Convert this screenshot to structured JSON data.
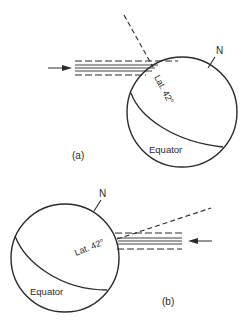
{
  "figure": {
    "panel_a": {
      "label": "(a)",
      "north_label": "N",
      "latitude_label": "Lat. 42°",
      "equator_label": "Equator"
    },
    "panel_b": {
      "label": "(b)",
      "north_label": "N",
      "latitude_label": "Lat. 42°",
      "equator_label": "Equator"
    }
  },
  "colors": {
    "ink": "#2a2a2a",
    "background": "#ffffff"
  }
}
